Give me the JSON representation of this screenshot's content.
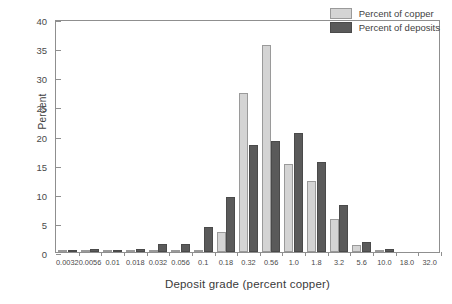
{
  "chart_data": {
    "type": "bar",
    "title": "",
    "xlabel": "Deposit grade (percent copper)",
    "ylabel": "Percent",
    "ylim": [
      0,
      40
    ],
    "yticks": [
      0,
      5,
      10,
      15,
      20,
      25,
      30,
      35,
      40
    ],
    "grid": false,
    "legend_position": "top-right",
    "categories": [
      "0.0032",
      "0.0056",
      "0.01",
      "0.018",
      "0.032",
      "0.056",
      "0.1",
      "0.18",
      "0.32",
      "0.56",
      "1.0",
      "1.8",
      "3.2",
      "5.6",
      "10.0",
      "18.0",
      "32.0"
    ],
    "series": [
      {
        "name": "Percent of copper",
        "color": "#d4d4d4",
        "values": [
          0.1,
          0.05,
          0.05,
          0.05,
          0.05,
          0.3,
          0.4,
          3.5,
          27.3,
          35.6,
          15.1,
          12.2,
          5.7,
          1.2,
          0.2,
          0.0,
          0.0
        ]
      },
      {
        "name": "Percent of deposits",
        "color": "#5a5a5a",
        "values": [
          0.2,
          0.45,
          0.35,
          0.6,
          1.4,
          1.35,
          4.3,
          9.4,
          18.4,
          19.1,
          20.5,
          15.4,
          8.0,
          1.7,
          0.55,
          0.0,
          0.0
        ]
      }
    ]
  }
}
